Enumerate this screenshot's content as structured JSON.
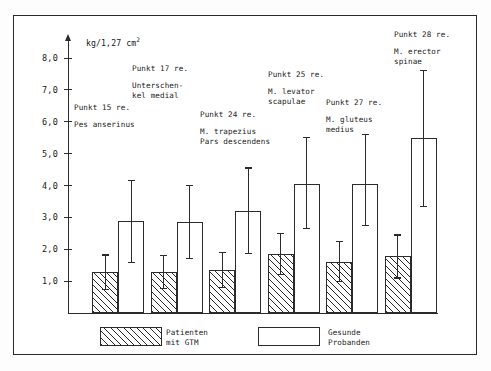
{
  "chart_data": {
    "type": "bar",
    "title": "",
    "subtitle": "",
    "xlabel": "",
    "ylabel": "kg/1,27 cm2",
    "unit_label": "kg/1,27 cm",
    "unit_exponent": "2",
    "ylim": [
      0,
      8.0
    ],
    "yticks": [
      "1,0",
      "2,0",
      "3,0",
      "4,0",
      "5,0",
      "6,0",
      "7,0",
      "8,0"
    ],
    "ytick_values": [
      1.0,
      2.0,
      3.0,
      4.0,
      5.0,
      6.0,
      7.0,
      8.0
    ],
    "grid": false,
    "legend_position": "bottom",
    "categories": [
      "Punkt 15 re. Pes anserinus",
      "Punkt 17 re. Unterschenkel medial",
      "Punkt 24 re. M. trapezius Pars descendens",
      "Punkt 25 re. M. levator scapulae",
      "Punkt 27 re. M. gluteus medius",
      "Punkt 28 re. M. erector spinae"
    ],
    "series": [
      {
        "name": "Patienten mit GTM",
        "fill": "hatched",
        "values": [
          1.3,
          1.28,
          1.35,
          1.85,
          1.6,
          1.78
        ],
        "err_upper": [
          1.82,
          1.8,
          1.9,
          2.5,
          2.25,
          2.45
        ],
        "err_lower": [
          0.75,
          0.78,
          0.8,
          1.2,
          1.0,
          1.1
        ]
      },
      {
        "name": "Gesunde Probanden",
        "fill": "white",
        "values": [
          2.88,
          2.85,
          3.2,
          4.05,
          4.05,
          5.5
        ],
        "err_upper": [
          4.15,
          4.0,
          4.55,
          5.5,
          5.6,
          7.6
        ],
        "err_lower": [
          1.6,
          1.72,
          1.88,
          2.65,
          2.75,
          3.35
        ]
      }
    ],
    "annotations": [
      {
        "punkt": "Punkt 15 re.",
        "muscle": "Pes anserinus"
      },
      {
        "punkt": "Punkt 17 re.",
        "muscle": "Unterschen-\nkel medial"
      },
      {
        "punkt": "Punkt 24 re.",
        "muscle": "M. trapezius\nPars descendens"
      },
      {
        "punkt": "Punkt 25 re.",
        "muscle": "M. levator\nscapulae"
      },
      {
        "punkt": "Punkt 27 re.",
        "muscle": "M. gluteus\nmedius"
      },
      {
        "punkt": "Punkt 28 re.",
        "muscle": "M. erector\nspinae"
      }
    ],
    "legend": [
      {
        "label": "Patienten\nmit GTM",
        "fill": "hatched"
      },
      {
        "label": "Gesunde\nProbanden",
        "fill": "white"
      }
    ],
    "colors": {
      "ink": "#2b2b2b",
      "paper": "#ffffff"
    }
  }
}
